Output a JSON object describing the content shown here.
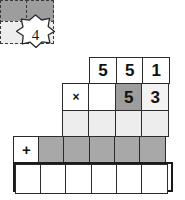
{
  "puzzle": {
    "badge": {
      "icon": "star-burst-icon",
      "value": "4"
    },
    "carry_block": {
      "rows": [
        {
          "cells": [
            {
              "value": "",
              "fill": "#9d9d9d"
            },
            {
              "value": "",
              "fill": "#9d9d9d"
            }
          ]
        },
        {
          "cells": [
            {
              "value": "",
              "fill": "#ededed"
            },
            {
              "value": "",
              "fill": "#ededed"
            }
          ]
        }
      ]
    },
    "rows": [
      {
        "name": "multiplicand-row",
        "cells": [
          {
            "value": "5",
            "fill": "#ffffff"
          },
          {
            "value": "5",
            "fill": "#ffffff"
          },
          {
            "value": "1",
            "fill": "#ffffff"
          }
        ]
      },
      {
        "name": "multiplier-row",
        "operator": "×",
        "cells": [
          {
            "value": "×",
            "fill": "#ffffff"
          },
          {
            "value": "",
            "fill": "#ffffff"
          },
          {
            "value": "5",
            "fill": "#9d9d9d"
          },
          {
            "value": "3",
            "fill": "#f2f2f2"
          }
        ]
      },
      {
        "name": "partial-product-row-1",
        "cells": [
          {
            "value": "",
            "fill": "#ededed"
          },
          {
            "value": "",
            "fill": "#ededed"
          },
          {
            "value": "",
            "fill": "#ededed"
          },
          {
            "value": "",
            "fill": "#ededed"
          }
        ]
      },
      {
        "name": "partial-product-row-2",
        "operator": "+",
        "cells": [
          {
            "value": "+",
            "fill": "#ffffff"
          },
          {
            "value": "",
            "fill": "#a8a8a8"
          },
          {
            "value": "",
            "fill": "#a8a8a8"
          },
          {
            "value": "",
            "fill": "#a8a8a8"
          },
          {
            "value": "",
            "fill": "#a8a8a8"
          },
          {
            "value": "",
            "fill": "#a8a8a8"
          }
        ]
      },
      {
        "name": "total-row",
        "cells": [
          {
            "value": "",
            "fill": "#ffffff"
          },
          {
            "value": "",
            "fill": "#ffffff"
          },
          {
            "value": "",
            "fill": "#ffffff"
          },
          {
            "value": "",
            "fill": "#ffffff"
          },
          {
            "value": "",
            "fill": "#ffffff"
          },
          {
            "value": "",
            "fill": "#ffffff"
          }
        ]
      }
    ],
    "colors": {
      "ink": "#111111",
      "border": "#2b2b2b",
      "thick_border": "#1a1a1a",
      "dark_gray": "#9d9d9d",
      "mid_gray": "#a8a8a8",
      "light_gray": "#ededed",
      "pale_gray": "#f2f2f2",
      "white": "#ffffff"
    }
  }
}
